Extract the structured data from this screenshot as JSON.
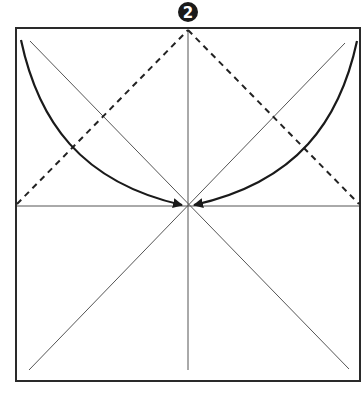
{
  "diagram": {
    "type": "origami-fold-step",
    "step_label": "2",
    "colors": {
      "frame": "#2a2a2a",
      "crease": "#555555",
      "dashed": "#222222",
      "arrow": "#1a1a1a",
      "badge": "#1a1a1a",
      "background": "#ffffff"
    },
    "square": {
      "x": 16,
      "y": 28,
      "size": 344
    },
    "creases": [
      {
        "name": "vertical-center",
        "x1": 188,
        "y1": 40,
        "x2": 188,
        "y2": 370
      },
      {
        "name": "horizontal-center",
        "x1": 16,
        "y1": 206,
        "x2": 360,
        "y2": 206
      },
      {
        "name": "diagonal-main",
        "x1": 30,
        "y1": 41,
        "x2": 349,
        "y2": 369
      },
      {
        "name": "diagonal-anti",
        "x1": 345,
        "y1": 43,
        "x2": 29,
        "y2": 370
      }
    ],
    "valley_folds": [
      {
        "name": "left-dashed",
        "x1": 17,
        "y1": 204,
        "x2": 188,
        "y2": 30
      },
      {
        "name": "right-dashed",
        "x1": 188,
        "y1": 30,
        "x2": 359,
        "y2": 204
      }
    ],
    "arrows": [
      {
        "name": "left-fold-arrow",
        "path": "M 21 40 C 40 120, 80 180, 170 200",
        "tip": [
          183,
          205
        ]
      },
      {
        "name": "right-fold-arrow",
        "path": "M 357 41 C 338 120, 298 180, 206 200",
        "tip": [
          193,
          205
        ]
      }
    ]
  }
}
